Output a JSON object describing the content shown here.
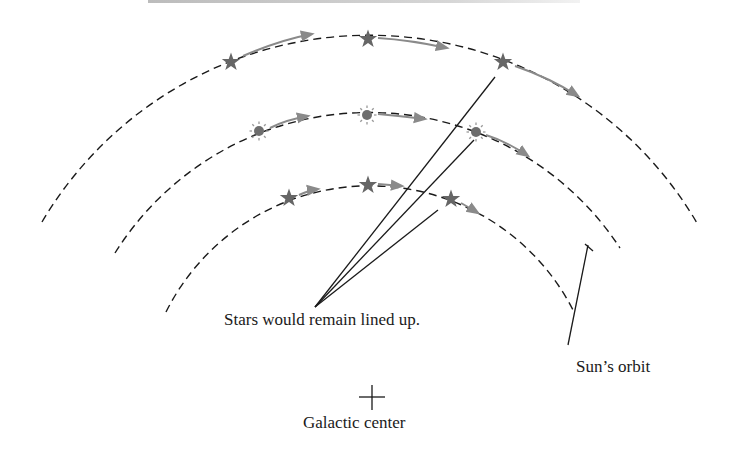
{
  "diagram": {
    "labels": {
      "lined_up": "Stars would remain lined up.",
      "sun_orbit": "Sun’s orbit",
      "galactic_center": "Galactic center"
    },
    "center_marker": "+",
    "orbits": [
      {
        "name": "outer-orbit",
        "body": "star",
        "positions": [
          [
            231,
            62
          ],
          [
            368,
            39
          ],
          [
            503,
            62
          ]
        ]
      },
      {
        "name": "sun-orbit",
        "body": "sun",
        "positions": [
          [
            259,
            131
          ],
          [
            367,
            115
          ],
          [
            476,
            132
          ]
        ]
      },
      {
        "name": "inner-orbit",
        "body": "star",
        "positions": [
          [
            289,
            198
          ],
          [
            368,
            185
          ],
          [
            451,
            199
          ]
        ]
      }
    ],
    "colors": {
      "dashed_orbit": "#1a1a1a",
      "motion_arrow": "#8a8a8a",
      "star": "#666666",
      "sun": "#6e6e6e"
    }
  }
}
